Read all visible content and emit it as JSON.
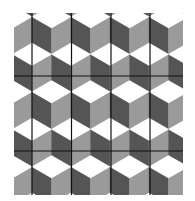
{
  "figure": {
    "type": "tessellation",
    "name": "tumbling-blocks",
    "width": 195,
    "height": 201,
    "background": "#ffffff",
    "bounds": {
      "x0": 14,
      "y0": 13,
      "x1": 183,
      "y1": 195
    },
    "tile": {
      "width": 39,
      "height": 75,
      "origin_x": 12.5,
      "origin_y": 1
    },
    "colors": {
      "top": "#ffffff",
      "left": "#555555",
      "right": "#9a9a9a",
      "line": "#111111"
    },
    "cube": {
      "half_width": 19.5,
      "tip": 11.25,
      "edge": 26.25
    },
    "grid_lines": {
      "vertical_x": [
        32,
        71.5,
        111,
        150
      ],
      "horizontal_y": [
        76,
        151
      ],
      "stroke_width": 1.2
    }
  }
}
